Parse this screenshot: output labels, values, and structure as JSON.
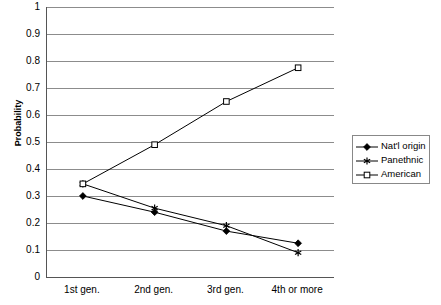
{
  "chart_data": {
    "type": "line",
    "title": "",
    "xlabel": "",
    "ylabel": "Probability",
    "categories": [
      "1st gen.",
      "2nd gen.",
      "3rd gen.",
      "4th or more"
    ],
    "ylim": [
      0,
      1
    ],
    "ytick_values": [
      0,
      0.1,
      0.2,
      0.3,
      0.4,
      0.5,
      0.6,
      0.7,
      0.8,
      0.9,
      1
    ],
    "ytick_labels": [
      "0",
      "0.1",
      "0.2",
      "0.3",
      "0.4",
      "0.5",
      "0.6",
      "0.7",
      "0.8",
      "0.9",
      "1"
    ],
    "grid": "horizontal",
    "legend_position": "right",
    "series": [
      {
        "name": "Nat'l origin",
        "marker": "filled-diamond",
        "color": "#000000",
        "values": [
          0.3,
          0.24,
          0.17,
          0.125
        ]
      },
      {
        "name": "Panethnic",
        "marker": "asterisk",
        "color": "#000000",
        "values": [
          0.345,
          0.255,
          0.19,
          0.09
        ]
      },
      {
        "name": "American",
        "marker": "open-square",
        "color": "#000000",
        "values": [
          0.345,
          0.49,
          0.65,
          0.775
        ]
      }
    ]
  },
  "axis": {
    "y_title": "Probability"
  },
  "legend": {
    "entries": [
      {
        "label": "Nat'l origin"
      },
      {
        "label": "Panethnic"
      },
      {
        "label": "American"
      }
    ]
  }
}
